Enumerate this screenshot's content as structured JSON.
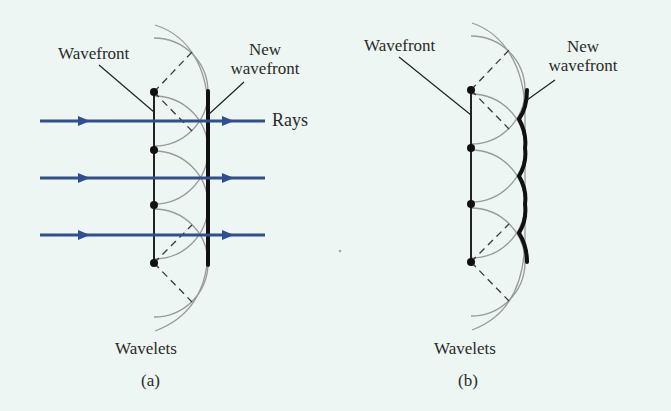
{
  "figure": {
    "panel_a": {
      "caption": "(a)",
      "labels": {
        "wavefront": "Wavefront",
        "new_wavefront_line1": "New",
        "new_wavefront_line2": "wavefront",
        "rays": "Rays",
        "wavelets": "Wavelets"
      },
      "description": "Plane wavefront with Huygens wavelets; new wavefront is a straight line tangent to wavelets; three rays with arrows"
    },
    "panel_b": {
      "caption": "(b)",
      "labels": {
        "wavefront": "Wavefront",
        "new_wavefront_line1": "New",
        "new_wavefront_line2": "wavefront",
        "wavelets": "Wavelets"
      },
      "description": "Same wavelets; new wavefront drawn as scalloped envelope of wavelet arcs"
    },
    "colors": {
      "background": "#edf6f2",
      "ray": "#2f4f8f",
      "wavelet": "#9a9a9a",
      "line": "#222222"
    }
  }
}
